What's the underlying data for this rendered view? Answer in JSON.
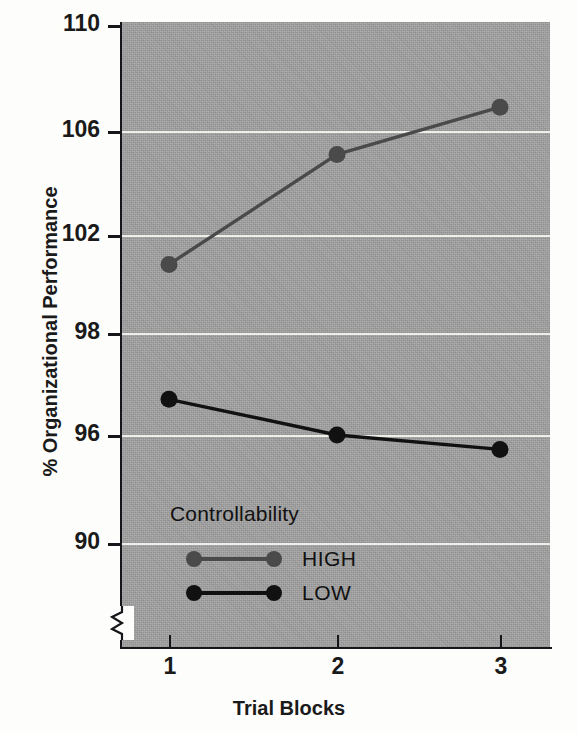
{
  "chart_data": {
    "type": "line",
    "title": "",
    "xlabel": "Trial Blocks",
    "ylabel": "% Organizational Performance",
    "x": [
      1,
      2,
      3
    ],
    "xtick_labels": [
      "1",
      "2",
      "3"
    ],
    "ytick_labels": [
      "110",
      "106",
      "102",
      "98",
      "96",
      "90"
    ],
    "ytick_values": [
      110,
      106,
      102,
      98,
      96,
      90
    ],
    "ylim": [
      90,
      110
    ],
    "grid": "horizontal",
    "axis_break": true,
    "legend_position": "inside-lower-left",
    "legend_title": "Controllability",
    "series": [
      {
        "name": "HIGH",
        "values": [
          100.8,
          105.1,
          106.9
        ],
        "color": "#4a4a4a"
      },
      {
        "name": "LOW",
        "values": [
          96.7,
          96.0,
          95.2
        ],
        "color": "#111111"
      }
    ],
    "plot_background": "#a0a0a0",
    "gridline_color": "#f2f2ee"
  },
  "axes": {
    "y_title": "% Organizational Performance",
    "x_title": "Trial Blocks",
    "y_ticks": [
      {
        "label": "110",
        "y": 25
      },
      {
        "label": "106",
        "y": 131
      },
      {
        "label": "102",
        "y": 235
      },
      {
        "label": "98",
        "y": 333
      },
      {
        "label": "96",
        "y": 435
      },
      {
        "label": "90",
        "y": 543
      }
    ],
    "x_ticks": [
      {
        "label": "1",
        "x": 169
      },
      {
        "label": "2",
        "x": 337
      },
      {
        "label": "3",
        "x": 500
      }
    ]
  },
  "legend": {
    "title": "Controllability",
    "entries": [
      {
        "label": "HIGH",
        "color": "#4a4a4a"
      },
      {
        "label": "LOW",
        "color": "#111111"
      }
    ]
  },
  "icons": {
    "axis_break": "axis-break-zigzag-icon"
  }
}
